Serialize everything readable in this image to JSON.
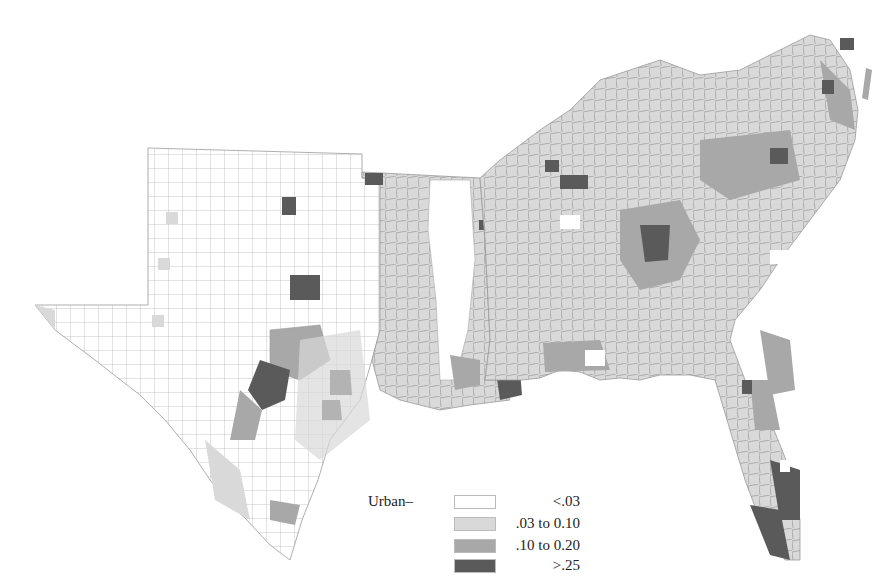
{
  "figure": {
    "region": "Southern United States (TX, OK, AR, LA, MS, AL, TN, KY, GA, FL, SC, NC, VA, WV, MD, DE)"
  },
  "legend": {
    "title": "Urban–",
    "items": [
      {
        "label": "<.03",
        "color": "#ffffff"
      },
      {
        "label": ".03 to 0.10",
        "color": "#d9d9d9"
      },
      {
        "label": ".10 to 0.20",
        "color": "#a8a8a8"
      },
      {
        "label": ">.25",
        "color": "#5a5a5a"
      }
    ]
  },
  "colors": {
    "border": "#9a9a9a",
    "class_0": "#ffffff",
    "class_1": "#d9d9d9",
    "class_2": "#a8a8a8",
    "class_3": "#5a5a5a"
  }
}
